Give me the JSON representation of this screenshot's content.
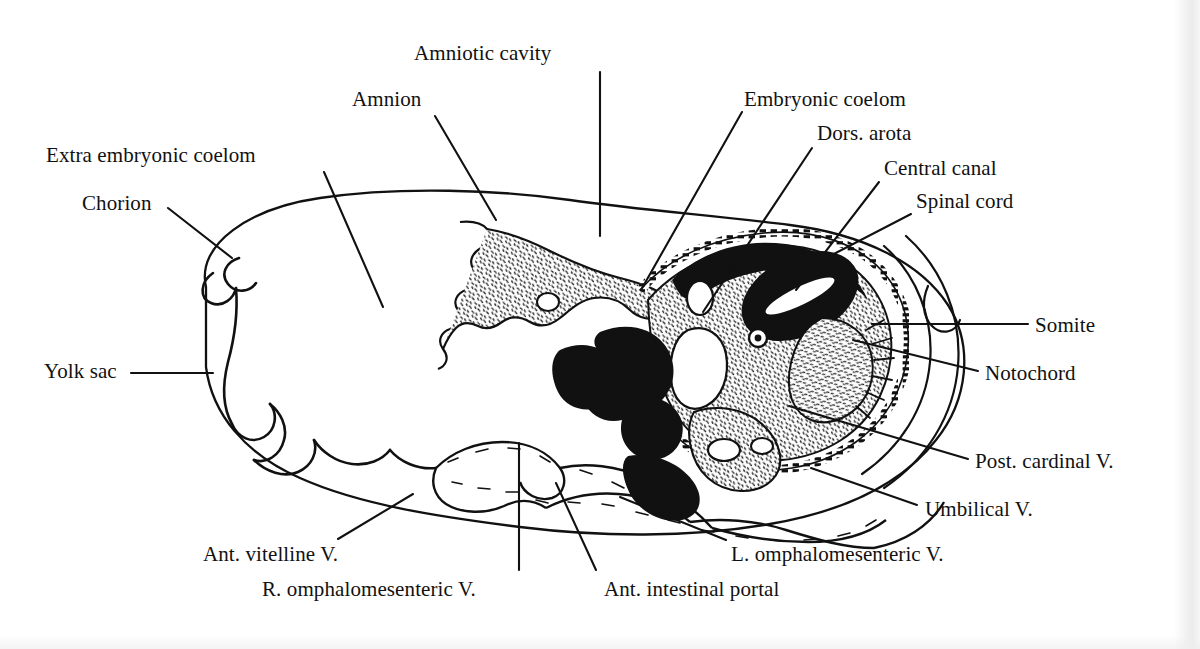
{
  "figure": {
    "domain": "anatomical line drawing",
    "ink_color": "#111111",
    "background_color": "#ffffff"
  },
  "labels": [
    {
      "id": "amniotic-cavity",
      "text": "Amniotic cavity",
      "x": 414,
      "y": 42,
      "align": "left"
    },
    {
      "id": "amnion",
      "text": "Amnion",
      "x": 352,
      "y": 88,
      "align": "left"
    },
    {
      "id": "embryonic-coelom",
      "text": "Embryonic coelom",
      "x": 744,
      "y": 88,
      "align": "left"
    },
    {
      "id": "dors-arota",
      "text": "Dors. arota",
      "x": 817,
      "y": 122,
      "align": "left"
    },
    {
      "id": "central-canal",
      "text": "Central canal",
      "x": 884,
      "y": 157,
      "align": "left"
    },
    {
      "id": "spinal-cord",
      "text": "Spinal cord",
      "x": 916,
      "y": 190,
      "align": "left"
    },
    {
      "id": "extra-embryonic-coelom",
      "text": "Extra embryonic coelom",
      "x": 46,
      "y": 144,
      "align": "left"
    },
    {
      "id": "chorion",
      "text": "Chorion",
      "x": 82,
      "y": 192,
      "align": "left"
    },
    {
      "id": "yolk-sac",
      "text": "Yolk sac",
      "x": 44,
      "y": 360,
      "align": "left"
    },
    {
      "id": "somite",
      "text": "Somite",
      "x": 1035,
      "y": 314,
      "align": "left"
    },
    {
      "id": "notochord",
      "text": "Notochord",
      "x": 985,
      "y": 362,
      "align": "left"
    },
    {
      "id": "post-cardinal-v",
      "text": "Post. cardinal V.",
      "x": 975,
      "y": 450,
      "align": "left"
    },
    {
      "id": "umbilical-v",
      "text": "Umbilical V.",
      "x": 925,
      "y": 498,
      "align": "left"
    },
    {
      "id": "l-omphalomesenteric-v",
      "text": "L. omphalomesenteric V.",
      "x": 731,
      "y": 543,
      "align": "left"
    },
    {
      "id": "ant-vitelline-v",
      "text": "Ant. vitelline V.",
      "x": 203,
      "y": 543,
      "align": "left"
    },
    {
      "id": "r-omphalomesenteric-v",
      "text": "R. omphalomesenteric V.",
      "x": 262,
      "y": 578,
      "align": "left"
    },
    {
      "id": "ant-intestinal-portal",
      "text": "Ant. intestinal portal",
      "x": 604,
      "y": 578,
      "align": "left"
    }
  ],
  "leader_lines": [
    {
      "id": "leader-amniotic-cavity",
      "for": "amniotic-cavity",
      "points": "600,72 600,236"
    },
    {
      "id": "leader-amnion",
      "for": "amnion",
      "points": "435,116 496,220"
    },
    {
      "id": "leader-embryonic-coelom",
      "for": "embryonic-coelom",
      "points": "742,112 641,290"
    },
    {
      "id": "leader-dors-arota",
      "for": "dors-arota",
      "points": "812,148 703,312"
    },
    {
      "id": "leader-central-canal",
      "for": "central-canal",
      "points": "879,182 796,290"
    },
    {
      "id": "leader-spinal-cord",
      "for": "spinal-cord",
      "points": "911,214 830,256"
    },
    {
      "id": "leader-extra-embryonic-coelom",
      "for": "extra-embryonic-coelom",
      "points": "324,172 383,307"
    },
    {
      "id": "leader-chorion",
      "for": "chorion",
      "points": "168,208 232,258"
    },
    {
      "id": "leader-yolk-sac",
      "for": "yolk-sac",
      "points": "131,373 213,373"
    },
    {
      "id": "leader-somite",
      "for": "somite",
      "points": "1028,324 872,324"
    },
    {
      "id": "leader-notochord",
      "for": "notochord",
      "points": "978,371 853,340"
    },
    {
      "id": "leader-post-cardinal-v",
      "for": "post-cardinal-v",
      "points": "968,459 789,406"
    },
    {
      "id": "leader-umbilical-v",
      "for": "umbilical-v",
      "points": "917,505 811,468"
    },
    {
      "id": "leader-l-omphalomesenteric-v",
      "for": "l-omphalomesenteric-v",
      "points": "726,540 620,497"
    },
    {
      "id": "leader-ant-vitelline-v",
      "for": "ant-vitelline-v",
      "points": "338,539 413,494"
    },
    {
      "id": "leader-r-omphalomesenteric-v",
      "for": "r-omphalomesenteric-v",
      "points": "519,570 519,443"
    },
    {
      "id": "leader-ant-intestinal-portal",
      "for": "ant-intestinal-portal",
      "points": "596,570 556,483"
    }
  ],
  "structures": [
    {
      "id": "chorion-outline",
      "name": "chorion"
    },
    {
      "id": "yolk-sac-outline",
      "name": "yolk-sac"
    },
    {
      "id": "amnion-fold",
      "name": "amnion"
    },
    {
      "id": "embryo-body",
      "name": "embryo-body"
    },
    {
      "id": "neural-tube",
      "name": "spinal-cord-neural-tube"
    },
    {
      "id": "notochord-body",
      "name": "notochord"
    },
    {
      "id": "somite-mass",
      "name": "somite"
    },
    {
      "id": "dorsal-aorta",
      "name": "dorsal-aorta"
    },
    {
      "id": "gut-tube",
      "name": "ant-intestinal-portal"
    },
    {
      "id": "vitelline-vessels",
      "name": "vitelline-vessels"
    }
  ]
}
